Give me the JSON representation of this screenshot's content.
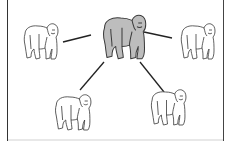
{
  "diagram": {
    "type": "network-star",
    "colors": {
      "background": "#ffffff",
      "frame": "#333333",
      "center_fill": "#bdbdbd",
      "outline": "#3a3a3a",
      "outer_fill": "#ffffff",
      "edge": "#222222"
    },
    "nodes": [
      {
        "id": "center",
        "role": "hub",
        "shaded": true,
        "x": 97,
        "y": 13,
        "w": 50,
        "h": 47
      },
      {
        "id": "left",
        "role": "leaf",
        "shaded": false,
        "x": 19,
        "y": 22,
        "w": 40,
        "h": 38
      },
      {
        "id": "right",
        "role": "leaf",
        "shaded": false,
        "x": 176,
        "y": 22,
        "w": 40,
        "h": 38
      },
      {
        "id": "bottom-left",
        "role": "leaf",
        "shaded": false,
        "x": 50,
        "y": 93,
        "w": 42,
        "h": 38
      },
      {
        "id": "bottom-right",
        "role": "leaf",
        "shaded": false,
        "x": 146,
        "y": 88,
        "w": 41,
        "h": 38
      }
    ],
    "edges": [
      {
        "from": "center",
        "to": "left",
        "x1": 91,
        "y1": 35,
        "x2": 63,
        "y2": 42
      },
      {
        "from": "center",
        "to": "right",
        "x1": 144,
        "y1": 32,
        "x2": 172,
        "y2": 38
      },
      {
        "from": "center",
        "to": "bottom-left",
        "x1": 104,
        "y1": 62,
        "x2": 80,
        "y2": 90
      },
      {
        "from": "center",
        "to": "bottom-right",
        "x1": 140,
        "y1": 62,
        "x2": 164,
        "y2": 92
      }
    ]
  }
}
